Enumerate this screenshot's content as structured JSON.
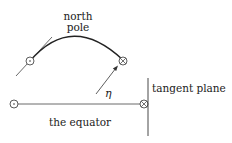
{
  "labels": {
    "north": "north",
    "pole": "pole",
    "eta": "η",
    "tangent_plane": "tangent plane",
    "equator": "the equator"
  },
  "colors": {
    "stroke": "#222222",
    "background": "#ffffff"
  },
  "symbols": {
    "circled_dot": "out-of-page vector",
    "circled_times": "into-page vector"
  }
}
